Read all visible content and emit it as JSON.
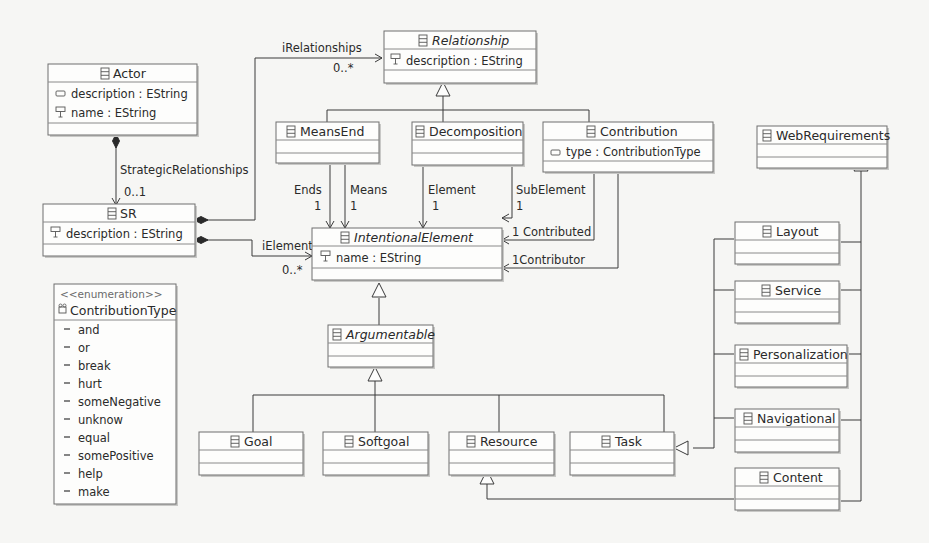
{
  "diagram": {
    "classes": {
      "actor": {
        "name": "Actor",
        "attributes": [
          "description : EString",
          "name : EString"
        ]
      },
      "sr": {
        "name": "SR",
        "attributes": [
          "description : EString"
        ]
      },
      "relationship": {
        "name": "Relationship",
        "abstract": true,
        "attributes": [
          "description : EString"
        ]
      },
      "means_end": {
        "name": "MeansEnd",
        "attributes": []
      },
      "decomposition": {
        "name": "Decomposition",
        "attributes": []
      },
      "contribution": {
        "name": "Contribution",
        "attributes": [
          "type : ContributionType"
        ]
      },
      "web_requirements": {
        "name": "WebRequirements",
        "attributes": []
      },
      "intentional_element": {
        "name": "IntentionalElement",
        "abstract": true,
        "attributes": [
          "name : EString"
        ]
      },
      "argumentable": {
        "name": "Argumentable",
        "abstract": true,
        "attributes": []
      },
      "goal": {
        "name": "Goal",
        "attributes": []
      },
      "softgoal": {
        "name": "Softgoal",
        "attributes": []
      },
      "resource": {
        "name": "Resource",
        "attributes": []
      },
      "task": {
        "name": "Task",
        "attributes": []
      },
      "layout": {
        "name": "Layout",
        "attributes": []
      },
      "service": {
        "name": "Service",
        "attributes": []
      },
      "personalization": {
        "name": "Personalization",
        "attributes": []
      },
      "navigational": {
        "name": "Navigational",
        "attributes": []
      },
      "content": {
        "name": "Content",
        "attributes": []
      }
    },
    "enumeration": {
      "stereotype": "<<enumeration>>",
      "name": "ContributionType",
      "literals": [
        "and",
        "or",
        "break",
        "hurt",
        "someNegative",
        "unknow",
        "equal",
        "somePositive",
        "help",
        "make"
      ]
    },
    "edge_labels": {
      "strategic_relationships": "StrategicRelationships",
      "strategic_relationships_mult": "0..1",
      "i_relationships": "iRelationships",
      "i_relationships_mult": "0..*",
      "i_element": "iElement",
      "i_element_mult": "0..*",
      "ends": "Ends",
      "ends_mult": "1",
      "means": "Means",
      "means_mult": "1",
      "element": "Element",
      "element_mult": "1",
      "sub_element": "SubElement",
      "sub_element_mult": "1",
      "contributed": "1 Contributed",
      "contributor": "1Contributor"
    },
    "icons": {
      "class": "eclass-icon",
      "attribute": "eattribute-icon",
      "id_attribute": "id-attribute-icon",
      "enum": "eenum-icon",
      "literal": "enum-literal-icon"
    }
  }
}
